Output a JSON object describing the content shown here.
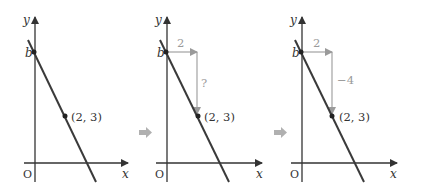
{
  "colors": {
    "axis": "#333333",
    "line": "#3a3a3a",
    "guide": "#9a9a9a",
    "step_arrow": "#b0b0b0"
  },
  "labels": {
    "y_axis": "y",
    "x_axis": "x",
    "origin": "O",
    "intercept": "b",
    "point": "(2,  3)"
  },
  "panels": [
    {
      "id": "panel-1",
      "run_label": null,
      "rise_label": null
    },
    {
      "id": "panel-2",
      "run_label": "2",
      "rise_label": "?"
    },
    {
      "id": "panel-3",
      "run_label": "2",
      "rise_label": "−4"
    }
  ],
  "p2": {
    "run": "2",
    "rise": "?"
  },
  "p3": {
    "run": "2",
    "rise": "−4"
  },
  "step_arrows": [
    "next-step",
    "next-step"
  ]
}
